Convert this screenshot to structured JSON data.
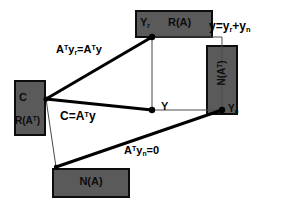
{
  "figure": {
    "background_color": "#ffffff",
    "box_fill_color": "#5a5a5a",
    "box_border_color": "#0d0d0d",
    "line_color": "#000000"
  },
  "boxes": [
    {
      "id": "row-space-box",
      "label_primary": "C",
      "label_secondary": "R(A",
      "label_secondary_sup": "T",
      "label_secondary_tail": ")",
      "x": 14,
      "y": 80,
      "w": 32,
      "h": 56
    },
    {
      "id": "range-box",
      "label_point": "Y",
      "label_point_sub": "r",
      "label_space": "R(A)",
      "x": 135,
      "y": 10,
      "w": 78,
      "h": 28
    },
    {
      "id": "left-null-space-box",
      "label_space": "N(A",
      "label_space_sup": "T",
      "label_space_tail": ")",
      "label_point": "Y",
      "label_point_sub": "n",
      "x": 206,
      "y": 45,
      "w": 32,
      "h": 70
    },
    {
      "id": "null-space-box",
      "label_space": "N(A)",
      "x": 52,
      "y": 168,
      "w": 78,
      "h": 30
    }
  ],
  "equations": {
    "top_right": {
      "lhs": "y",
      "eq": "=y",
      "sub1": "r",
      "plus": "+y",
      "sub2": "n"
    },
    "upper_left": {
      "a1": "A",
      "sup1": "T",
      "y1": "y",
      "sub1": "r",
      "eq": "=A",
      "sup2": "T",
      "y2": "y"
    },
    "middle_left": {
      "c": "C",
      "eq": "=A",
      "sup": "T",
      "y": "y"
    },
    "bottom": {
      "a": "A",
      "sup": "T",
      "y": "y",
      "sub": "n",
      "eq": "=0"
    }
  },
  "points": [
    {
      "id": "point-y",
      "label": "Y",
      "x": 152,
      "y": 110
    },
    {
      "id": "point-yr",
      "label": "Yr",
      "x": 152,
      "y": 37
    },
    {
      "id": "point-yn",
      "label": "Yn",
      "x": 222,
      "y": 110
    },
    {
      "id": "point-c",
      "label": "C",
      "x": 45,
      "y": 99
    },
    {
      "id": "point-origin",
      "label": "",
      "x": 56,
      "y": 167
    }
  ],
  "center_label": "Y"
}
